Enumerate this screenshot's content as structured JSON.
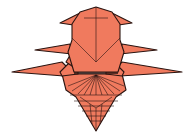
{
  "figure": {
    "colors": {
      "paper": "#F07A5E",
      "line": "#2a1410",
      "background": "#ffffff"
    }
  }
}
